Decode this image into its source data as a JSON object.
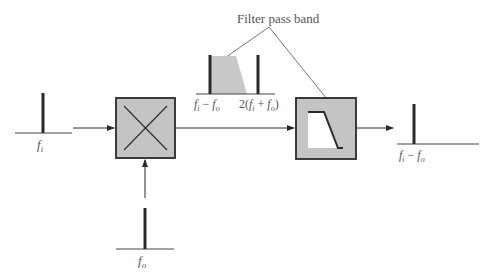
{
  "diagram": {
    "type": "superheterodyne mixer and filter block diagram",
    "colors": {
      "line": "#2a2a2a",
      "box_fill": "#c4c4c4",
      "passband_fill": "#c8c8c8",
      "text": "#555555",
      "background": "#ffffff"
    },
    "annotation": {
      "text": "Filter pass band"
    },
    "input_spectrum": {
      "label_main": "f",
      "label_sub": "i"
    },
    "lo_spectrum": {
      "label_main": "f",
      "label_sub": "o"
    },
    "mixer_output_spectrum": {
      "label_left_f1": "f",
      "label_left_s1": "i",
      "label_left_minus": " − ",
      "label_left_f2": "f",
      "label_left_s2": "o",
      "label_right_prefix": "2(",
      "label_right_f1": "f",
      "label_right_s1": "i",
      "label_right_plus": " + ",
      "label_right_f2": "f",
      "label_right_s2": "o",
      "label_right_suffix": ")"
    },
    "output_spectrum": {
      "label_f1": "f",
      "label_s1": "i",
      "label_minus": " − ",
      "label_f2": "f",
      "label_s2": "o"
    },
    "blocks": [
      {
        "name": "mixer",
        "symbol": "multiply-x"
      },
      {
        "name": "bandpass-filter",
        "symbol": "trapezoid-passband"
      }
    ]
  }
}
